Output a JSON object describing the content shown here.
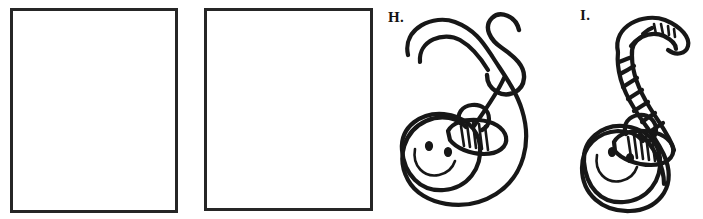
{
  "page": {
    "type": "handwriting-worksheet-row",
    "background_color": "#ffffff",
    "ink_color": "#171717"
  },
  "answer_boxes": [
    {
      "id": "box-a",
      "label": "",
      "border_color": "#262626",
      "content": ""
    },
    {
      "id": "box-b",
      "label": "",
      "border_color": "#262626",
      "content": ""
    }
  ],
  "panels": [
    {
      "id": "panel-h",
      "label": "H.",
      "figure_name": "smiling-s-worm-with-hat",
      "description_parts": [
        "large-s-body",
        "smiling-face",
        "striped-hat",
        "letter-s"
      ],
      "letter_shown": "S"
    },
    {
      "id": "panel-i",
      "label": "I.",
      "figure_name": "segmented-s-worm-with-hat",
      "description_parts": [
        "striped-s-body",
        "smiling-face",
        "striped-hat",
        "segment-ribs"
      ],
      "letter_shown": ""
    }
  ]
}
